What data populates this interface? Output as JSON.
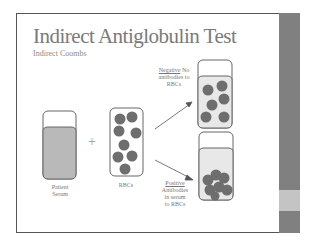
{
  "slide": {
    "title": "Indirect Antiglobulin Test",
    "subtitle": "Indirect Coombs"
  },
  "diagram": {
    "serum_label_line1": "Patient",
    "serum_label_line2": "Serum",
    "plus_sign": "+",
    "rbc_label": "RBCs",
    "negative": {
      "heading": "Negative",
      "line1_rest": " No",
      "line2": "antibodies to",
      "line3": "RBCs"
    },
    "positive": {
      "heading": "Positive",
      "line2": "Antibodies",
      "line3": "in serum",
      "line4": "to RBCs"
    }
  },
  "colors": {
    "cell": "#6e6e6e",
    "serum": "#b9b9b9",
    "sidebar": "#808080"
  }
}
